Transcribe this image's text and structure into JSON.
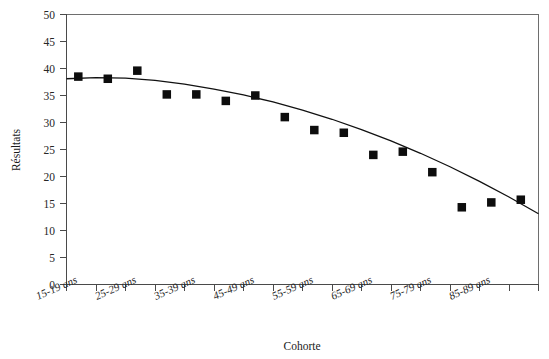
{
  "chart_data": {
    "type": "scatter",
    "title": "",
    "xlabel": "Cohorte",
    "ylabel": "Résultats",
    "ylim": [
      0,
      50
    ],
    "ytick_step": 5,
    "yticks": [
      "0",
      "5",
      "10",
      "15",
      "20",
      "25",
      "30",
      "35",
      "40",
      "45",
      "50"
    ],
    "grid": false,
    "legend": null,
    "marker_style": "filled-square",
    "marker_color": "#0d0d0d",
    "curve_color": "#111111",
    "curve_label": "fitted trend curve",
    "n_tick_positions": 17,
    "categories": [
      "15-19 ans",
      "20-24 ans",
      "25-29 ans",
      "30-34 ans",
      "35-39 ans",
      "40-44 ans",
      "45-49 ans",
      "50-54 ans",
      "55-59 ans",
      "60-64 ans",
      "65-69 ans",
      "70-74 ans",
      "75-79 ans",
      "80-84 ans",
      "85-89 ans",
      "90-94 ans"
    ],
    "visible_xtick_labels": [
      {
        "index": 0,
        "label": "15-19 ans"
      },
      {
        "index": 2,
        "label": "25-29 ans"
      },
      {
        "index": 4,
        "label": "35-39 ans"
      },
      {
        "index": 6,
        "label": "45-49 ans"
      },
      {
        "index": 8,
        "label": "55-59 ans"
      },
      {
        "index": 10,
        "label": "65-69 ans"
      },
      {
        "index": 12,
        "label": "75-79 ans"
      },
      {
        "index": 14,
        "label": "85-89 ans"
      }
    ],
    "values": [
      38.5,
      38.1,
      39.6,
      35.2,
      35.2,
      34.0,
      35.0,
      31.0,
      28.6,
      28.1,
      24.0,
      24.6,
      20.8,
      14.3,
      15.2,
      15.7
    ],
    "series": [
      {
        "name": "Résultats par cohorte",
        "values": [
          38.5,
          38.1,
          39.6,
          35.2,
          35.2,
          34.0,
          35.0,
          31.0,
          28.6,
          28.1,
          24.0,
          24.6,
          20.8,
          14.3,
          15.2,
          15.7
        ]
      }
    ],
    "fit_curve_points": [
      [
        0,
        38.1
      ],
      [
        1,
        38.3
      ],
      [
        2,
        38.2
      ],
      [
        3,
        37.8
      ],
      [
        4,
        37.1
      ],
      [
        5,
        36.2
      ],
      [
        6,
        35.1
      ],
      [
        7,
        33.8
      ],
      [
        8,
        32.3
      ],
      [
        9,
        30.6
      ],
      [
        10,
        28.7
      ],
      [
        11,
        26.6
      ],
      [
        12,
        24.3
      ],
      [
        13,
        21.8
      ],
      [
        14,
        19.1
      ],
      [
        15,
        16.2
      ],
      [
        16,
        13.1
      ]
    ]
  }
}
